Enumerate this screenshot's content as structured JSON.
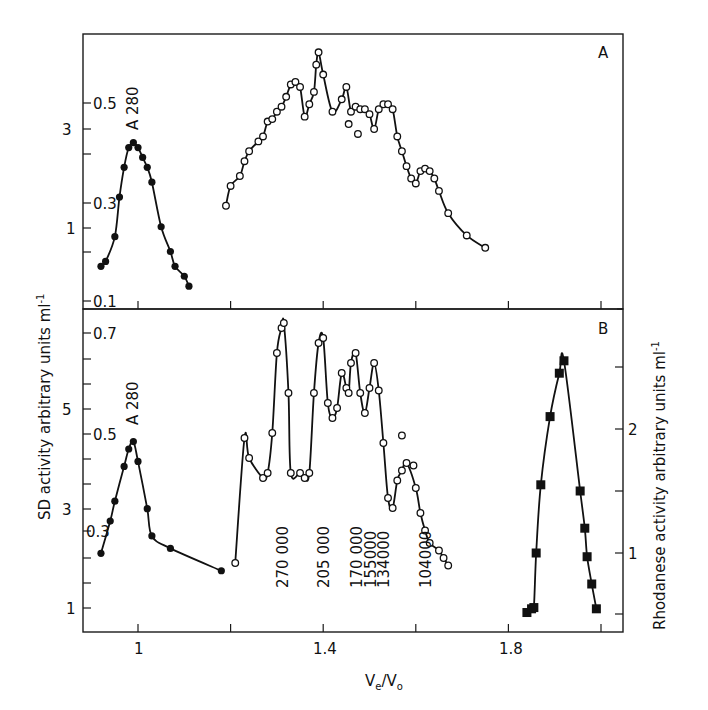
{
  "figure": {
    "x_axis_label_main": "V",
    "x_axis_label_sub_e": "e",
    "x_axis_label_slash": "/V",
    "x_axis_label_sub_o": "o",
    "left_axis_label": "SD activity arbitrary units ml",
    "left_axis_label_sup": "-1",
    "right_axis_label": "Rhodanese activity arbitrary units ml",
    "right_axis_label_sup": "-1",
    "panel_a_letter": "A",
    "panel_b_letter": "B",
    "a280_label_a": "A 280",
    "a280_label_b": "A 280",
    "x_tick_labels": [
      "1",
      "1.4",
      "1.8"
    ],
    "panel_a_left_ticks": [
      "3",
      "1"
    ],
    "panel_a_a280_ticks": [
      "0.5",
      "0.3",
      "0.1"
    ],
    "panel_b_left_ticks": [
      "5",
      "3",
      "1"
    ],
    "panel_b_a280_ticks": [
      "0.7",
      "0.5",
      "0.3"
    ],
    "panel_b_right_ticks": [
      "2",
      "1"
    ],
    "mw_markers": [
      "270 000",
      "205 000",
      "170 000",
      "155000",
      "134000",
      "104000"
    ]
  },
  "chart_data": [
    {
      "type": "line",
      "panel": "A",
      "title": "A",
      "xlabel": "Ve/Vo",
      "ylabel": "SD activity arbitrary units ml-1",
      "xlim": [
        0.88,
        2.03
      ],
      "ylim_sd": [
        0,
        4.0
      ],
      "ylim_a280": [
        0.1,
        0.66
      ],
      "x_ticks": [
        1.0,
        1.2,
        1.4,
        1.6,
        1.8,
        2.0
      ],
      "x_tick_labels": [
        "1",
        "",
        "1.4",
        "",
        "1.8",
        ""
      ],
      "series": [
        {
          "name": "A 280",
          "marker": "filled-circle",
          "axis": "A280 (inner left)",
          "x": [
            0.92,
            0.93,
            0.95,
            0.96,
            0.97,
            0.98,
            0.99,
            1.0,
            1.01,
            1.02,
            1.03,
            1.05,
            1.07,
            1.08,
            1.1,
            1.11
          ],
          "y": [
            0.17,
            0.18,
            0.23,
            0.31,
            0.37,
            0.41,
            0.42,
            0.41,
            0.39,
            0.37,
            0.34,
            0.25,
            0.2,
            0.17,
            0.15,
            0.13
          ]
        },
        {
          "name": "SD activity",
          "marker": "open-circle",
          "axis": "SD (left)",
          "x": [
            1.19,
            1.2,
            1.22,
            1.23,
            1.24,
            1.26,
            1.27,
            1.28,
            1.29,
            1.3,
            1.31,
            1.32,
            1.33,
            1.34,
            1.35,
            1.36,
            1.37,
            1.38,
            1.385,
            1.39,
            1.4,
            1.42,
            1.44,
            1.45,
            1.46,
            1.47,
            1.48,
            1.49,
            1.5,
            1.51,
            1.52,
            1.53,
            1.54,
            1.55,
            1.56,
            1.57,
            1.58,
            1.59,
            1.6,
            1.61,
            1.62,
            1.63,
            1.64,
            1.65,
            1.67,
            1.71,
            1.75
          ],
          "y": [
            1.45,
            1.85,
            2.05,
            2.35,
            2.55,
            2.75,
            2.85,
            3.15,
            3.2,
            3.35,
            3.45,
            3.65,
            3.9,
            3.95,
            3.85,
            3.25,
            3.5,
            3.75,
            4.3,
            4.55,
            4.1,
            3.35,
            3.6,
            3.85,
            3.35,
            3.45,
            3.4,
            3.4,
            3.3,
            3.0,
            3.4,
            3.5,
            3.5,
            3.4,
            2.85,
            2.55,
            2.25,
            2.0,
            1.9,
            2.15,
            2.2,
            2.15,
            2.0,
            1.75,
            1.3,
            0.85,
            0.6
          ],
          "outliers": [
            {
              "x": 1.455,
              "y": 3.1
            },
            {
              "x": 1.475,
              "y": 2.9
            }
          ]
        }
      ]
    },
    {
      "type": "line",
      "panel": "B",
      "title": "B",
      "xlabel": "Ve/Vo",
      "ylabel": "SD activity arbitrary units ml-1",
      "ylabel_right": "Rhodanese activity arbitrary units ml-1",
      "xlim": [
        0.88,
        2.03
      ],
      "ylim_sd": [
        0.6,
        7.0
      ],
      "ylim_a280": [
        0.22,
        0.74
      ],
      "ylim_rhodanese": [
        0.45,
        3.0
      ],
      "x_ticks": [
        1.0,
        1.2,
        1.4,
        1.6,
        1.8,
        2.0
      ],
      "x_tick_labels": [
        "1",
        "",
        "1.4",
        "",
        "1.8",
        ""
      ],
      "series": [
        {
          "name": "A 280",
          "marker": "filled-circle",
          "axis": "A280 (inner left)",
          "x": [
            0.92,
            0.94,
            0.95,
            0.97,
            0.98,
            0.99,
            1.0,
            1.02,
            1.03,
            1.07,
            1.18
          ],
          "y": [
            0.255,
            0.32,
            0.36,
            0.43,
            0.465,
            0.48,
            0.44,
            0.345,
            0.29,
            0.265,
            0.22
          ]
        },
        {
          "name": "SD activity",
          "marker": "open-circle",
          "axis": "SD (left)",
          "x": [
            1.21,
            1.23,
            1.24,
            1.27,
            1.28,
            1.29,
            1.3,
            1.31,
            1.315,
            1.325,
            1.33,
            1.35,
            1.36,
            1.37,
            1.38,
            1.39,
            1.4,
            1.41,
            1.42,
            1.43,
            1.44,
            1.45,
            1.455,
            1.46,
            1.47,
            1.48,
            1.49,
            1.5,
            1.51,
            1.52,
            1.53,
            1.54,
            1.55,
            1.56,
            1.57,
            1.58,
            1.6,
            1.61,
            1.62,
            1.63,
            1.65,
            1.66,
            1.67
          ],
          "y": [
            1.9,
            4.4,
            4.0,
            3.6,
            3.7,
            4.5,
            6.1,
            6.6,
            6.7,
            5.3,
            3.7,
            3.7,
            3.6,
            3.7,
            5.3,
            6.3,
            6.4,
            5.1,
            4.8,
            5.0,
            5.7,
            5.4,
            5.3,
            5.9,
            6.1,
            5.3,
            4.9,
            5.4,
            5.9,
            5.35,
            4.3,
            3.2,
            3.0,
            3.55,
            3.75,
            3.9,
            3.4,
            2.9,
            2.55,
            2.3,
            2.15,
            2.0,
            1.85
          ],
          "outliers": [
            {
              "x": 1.57,
              "y": 4.45
            },
            {
              "x": 1.595,
              "y": 3.85
            }
          ]
        },
        {
          "name": "Rhodanese activity",
          "marker": "filled-square",
          "axis": "Rhodanese (right)",
          "x": [
            1.84,
            1.85,
            1.855,
            1.86,
            1.87,
            1.89,
            1.91,
            1.92,
            1.955,
            1.965,
            1.97,
            1.98,
            1.99
          ],
          "y": [
            0.52,
            0.55,
            0.56,
            1.0,
            1.55,
            2.1,
            2.45,
            2.55,
            1.5,
            1.2,
            0.97,
            0.75,
            0.55
          ]
        }
      ],
      "annotations": [
        "270 000",
        "205 000",
        "170 000",
        "155000",
        "134000",
        "104000"
      ],
      "annotation_x": [
        1.31,
        1.4,
        1.47,
        1.5,
        1.53,
        1.62
      ]
    }
  ]
}
